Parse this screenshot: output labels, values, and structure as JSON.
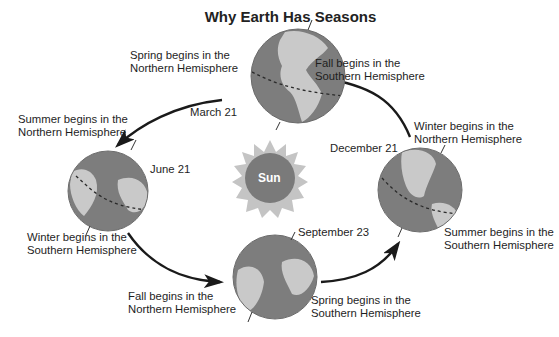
{
  "title": "Why Earth Has Seasons",
  "sun": {
    "label": "Sun",
    "core_color": "#7a7a7a",
    "ray_color": "#c4c4c4"
  },
  "colors": {
    "ocean": "#7d7d7d",
    "land": "#c9c9c9",
    "arrow": "#1a1a1a",
    "text": "#1e1e1e"
  },
  "positions": [
    {
      "date": "March 21",
      "label_before": {
        "line1": "Spring begins in the",
        "line2": "Northern Hemisphere"
      },
      "label_after": {
        "line1": "Fall begins in the",
        "line2": "Southern Hemisphere"
      }
    },
    {
      "date": "June 21",
      "label_before": {
        "line1": "Summer begins in the",
        "line2": "Northern Hemisphere"
      },
      "label_after": {
        "line1": "Winter begins in the",
        "line2": "Southern Hemisphere"
      }
    },
    {
      "date": "September 23",
      "label_before": {
        "line1": "Fall begins in the",
        "line2": "Northern Hemisphere"
      },
      "label_after": {
        "line1": "Spring begins in the",
        "line2": "Southern Hemisphere"
      }
    },
    {
      "date": "December 21",
      "label_before": {
        "line1": "Winter begins in the",
        "line2": "Northern Hemisphere"
      },
      "label_after": {
        "line1": "Summer begins in the",
        "line2": "Southern Hemisphere"
      }
    }
  ]
}
